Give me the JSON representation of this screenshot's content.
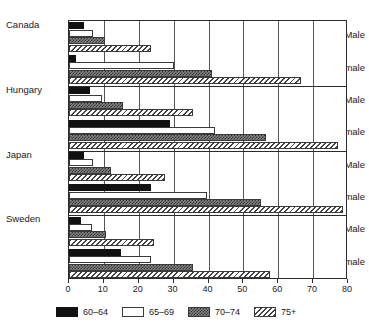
{
  "chart_data": {
    "type": "bar",
    "orientation": "horizontal",
    "title": "",
    "subtitle": "",
    "xlabel": "",
    "ylabel": "",
    "xlim": [
      0,
      80
    ],
    "xticks": [
      0,
      10,
      20,
      30,
      40,
      50,
      60,
      70,
      80
    ],
    "xtick_labels": [
      "0",
      "10",
      "20",
      "30",
      "40",
      "50",
      "60",
      "70",
      "80"
    ],
    "grid": "vertical",
    "legend_position": "bottom",
    "groups": [
      "Canada",
      "Hungary",
      "Japan",
      "Sweden"
    ],
    "subgroups": [
      "Male",
      "Female"
    ],
    "series": [
      {
        "name": "60–64",
        "pattern": "solid-black",
        "color": "#111111"
      },
      {
        "name": "65–69",
        "pattern": "fine-dotted",
        "color": "#ffffff"
      },
      {
        "name": "70–74",
        "pattern": "grey-crosshatch",
        "color": "#8a8a8a"
      },
      {
        "name": "75+",
        "pattern": "diagonal-stripe",
        "color": "#ffffff"
      }
    ],
    "panels": [
      {
        "country": "Canada",
        "rows": [
          {
            "sex": "Male",
            "values": [
              4.3,
              7.0,
              10.3,
              23.5
            ]
          },
          {
            "sex": "Female",
            "values": [
              2.0,
              30.0,
              41.0,
              66.5
            ]
          }
        ]
      },
      {
        "country": "Hungary",
        "rows": [
          {
            "sex": "Male",
            "values": [
              6.0,
              9.5,
              15.5,
              35.5
            ]
          },
          {
            "sex": "Female",
            "values": [
              29.0,
              42.0,
              56.5,
              77.0
            ]
          }
        ]
      },
      {
        "country": "Japan",
        "rows": [
          {
            "sex": "Male",
            "values": [
              4.3,
              7.0,
              12.0,
              27.5
            ]
          },
          {
            "sex": "Female",
            "values": [
              23.5,
              39.5,
              55.0,
              78.5
            ]
          }
        ]
      },
      {
        "country": "Sweden",
        "rows": [
          {
            "sex": "Male",
            "values": [
              3.5,
              6.5,
              10.5,
              24.5
            ]
          },
          {
            "sex": "Female",
            "values": [
              15.0,
              23.5,
              35.5,
              57.5
            ]
          }
        ]
      }
    ]
  },
  "axis": {
    "ticks": [
      "0",
      "10",
      "20",
      "30",
      "40",
      "50",
      "60",
      "70",
      "80"
    ]
  },
  "labels": {
    "countries": [
      "Canada",
      "Hungary",
      "Japan",
      "Sweden"
    ],
    "sexes": [
      "Male",
      "Female"
    ]
  },
  "legend": {
    "items": [
      {
        "label": "60–64"
      },
      {
        "label": "65–69"
      },
      {
        "label": "70–74"
      },
      {
        "label": "75+"
      }
    ]
  }
}
